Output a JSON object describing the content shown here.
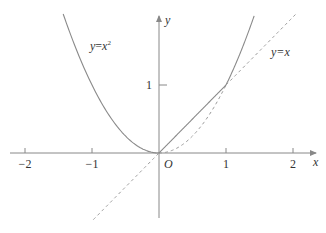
{
  "figure": {
    "type": "function-graph",
    "axes": {
      "x_label": "x",
      "y_label": "y",
      "origin_label": "O",
      "x_ticks": [
        {
          "value": -2,
          "label": "−2"
        },
        {
          "value": -1,
          "label": "−1"
        },
        {
          "value": 1,
          "label": "1"
        },
        {
          "value": 2,
          "label": "2"
        }
      ],
      "y_ticks": [
        {
          "value": 1,
          "label": "1"
        }
      ],
      "x_range": [
        -2.2,
        2.4
      ],
      "y_range": [
        -0.97,
        2.05
      ]
    },
    "curves": [
      {
        "name": "parabola",
        "label": "y=x²",
        "expression": "y = x^2",
        "solid_domains": [
          [
            -1.43,
            0
          ],
          [
            1,
            1.42
          ]
        ],
        "dashed_domains": [
          [
            0,
            1
          ]
        ]
      },
      {
        "name": "line",
        "label": "y=x",
        "expression": "y = x",
        "solid_domains": [
          [
            0,
            1
          ]
        ],
        "dashed_domains": [
          [
            -0.98,
            0
          ],
          [
            1,
            2.05
          ]
        ]
      }
    ],
    "colors": {
      "axis": "#888888",
      "solid_curve": "#8a8a8a",
      "dashed_curve": "#9a9a9a",
      "text": "#333333"
    }
  },
  "labels": {
    "parabola_label_y": "y",
    "parabola_label_eq": "=",
    "parabola_label_x": "x",
    "parabola_label_exp": "2",
    "line_label": "y=x"
  }
}
